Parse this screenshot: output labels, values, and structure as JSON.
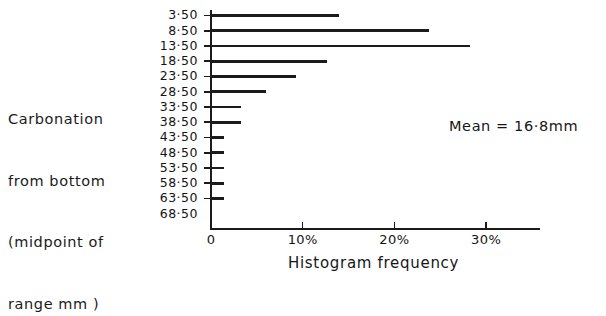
{
  "chart_data": {
    "type": "bar",
    "orientation": "horizontal",
    "title": "",
    "xlabel": "Histogram frequency",
    "ylabel": "Carbonation from bottom (midpoint of range mm )",
    "categories": [
      "3·50",
      "8·50",
      "13·50",
      "18·50",
      "23·50",
      "28·50",
      "33·50",
      "38·50",
      "43·50",
      "48·50",
      "53·50",
      "58·50",
      "63·50",
      "68·50"
    ],
    "values": [
      14.0,
      23.8,
      28.2,
      12.6,
      9.3,
      6.0,
      3.3,
      3.3,
      1.4,
      1.4,
      1.4,
      1.4,
      1.4,
      0.0
    ],
    "xlim": [
      0,
      36
    ],
    "ylim": null,
    "grid": false,
    "legend": null,
    "xticks": [
      {
        "value": 0,
        "label": "0"
      },
      {
        "value": 10,
        "label": "10%"
      },
      {
        "value": 20,
        "label": "20%"
      },
      {
        "value": 30,
        "label": "30%"
      }
    ],
    "annotations": [
      {
        "name": "mean",
        "text": "Mean = 16·8mm"
      }
    ]
  },
  "axis_caption": {
    "lines": [
      "Carbonation",
      "from bottom",
      "(midpoint of",
      "range mm )"
    ]
  },
  "annotation": {
    "mean_text": "Mean = 16·8mm"
  },
  "x_axis": {
    "title": "Histogram frequency"
  }
}
